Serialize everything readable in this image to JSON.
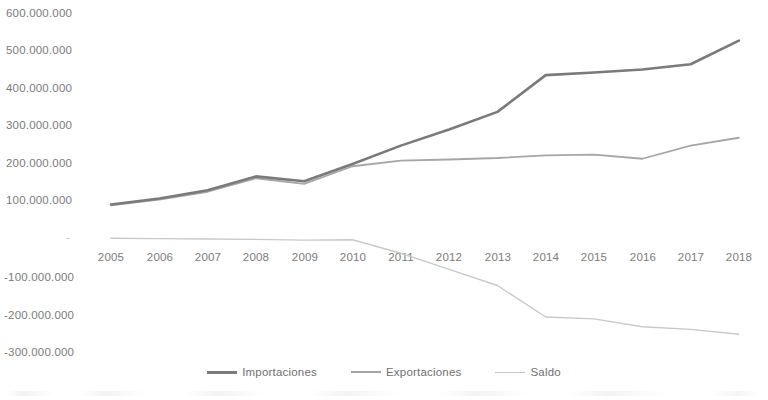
{
  "chart_data": {
    "type": "line",
    "title": "",
    "xlabel": "",
    "ylabel": "",
    "x": [
      2005,
      2006,
      2007,
      2008,
      2009,
      2010,
      2011,
      2012,
      2013,
      2014,
      2015,
      2016,
      2017,
      2018
    ],
    "categories": [
      "2005",
      "2006",
      "2007",
      "2008",
      "2009",
      "2010",
      "2011",
      "2012",
      "2013",
      "2014",
      "2015",
      "2016",
      "2017",
      "2018"
    ],
    "series": [
      {
        "name": "Importaciones",
        "color": "#7a7a7a",
        "width": 2.6,
        "values": [
          88000000,
          104000000,
          126000000,
          163000000,
          150000000,
          196000000,
          245000000,
          288000000,
          335000000,
          433000000,
          440000000,
          448000000,
          462000000,
          525000000
        ]
      },
      {
        "name": "Exportaciones",
        "color": "#a6a6a6",
        "width": 1.8,
        "values": [
          86000000,
          101000000,
          122000000,
          158000000,
          143000000,
          190000000,
          205000000,
          208000000,
          212000000,
          219000000,
          221000000,
          210000000,
          245000000,
          266000000
        ]
      },
      {
        "name": "Saldo",
        "color": "#c9c9c9",
        "width": 1.4,
        "values": [
          -2000000,
          -3000000,
          -4000000,
          -5000000,
          -7000000,
          -6000000,
          -42000000,
          -85000000,
          -128000000,
          -212000000,
          -217000000,
          -238000000,
          -245000000,
          -258000000
        ]
      }
    ],
    "ylim": [
      -350000000,
      630000000
    ],
    "y_ticks": [
      600000000,
      500000000,
      400000000,
      300000000,
      200000000,
      100000000,
      0,
      -100000000,
      -200000000,
      -300000000
    ],
    "y_tick_labels": [
      "600.000.000",
      "500.000.000",
      "400.000.000",
      "300.000.000",
      "200.000.000",
      "100.000.000",
      "-",
      "-100.000.000",
      "-200.000.000",
      "-300.000.000"
    ],
    "grid": false,
    "legend_position": "bottom"
  },
  "legend": {
    "items": [
      {
        "label": "Importaciones",
        "color": "#7a7a7a",
        "thickness": "3px"
      },
      {
        "label": "Exportaciones",
        "color": "#a3a3a3",
        "thickness": "2px"
      },
      {
        "label": "Saldo",
        "color": "#c7c7c7",
        "thickness": "1.5px"
      }
    ]
  },
  "axes": {
    "y_labels": [
      "600.000.000",
      "500.000.000",
      "400.000.000",
      "300.000.000",
      "200.000.000",
      "100.000.000",
      "-",
      "-100.000.000",
      "-200.000.000",
      "-300.000.000"
    ],
    "x_labels": [
      "2005",
      "2006",
      "2007",
      "2008",
      "2009",
      "2010",
      "2011",
      "2012",
      "2013",
      "2014",
      "2015",
      "2016",
      "2017",
      "2018"
    ]
  },
  "colors": {
    "importaciones": "#7a7a7a",
    "exportaciones": "#a6a6a6",
    "saldo": "#c9c9c9",
    "text": "#7b7b7b",
    "background": "#ffffff"
  }
}
